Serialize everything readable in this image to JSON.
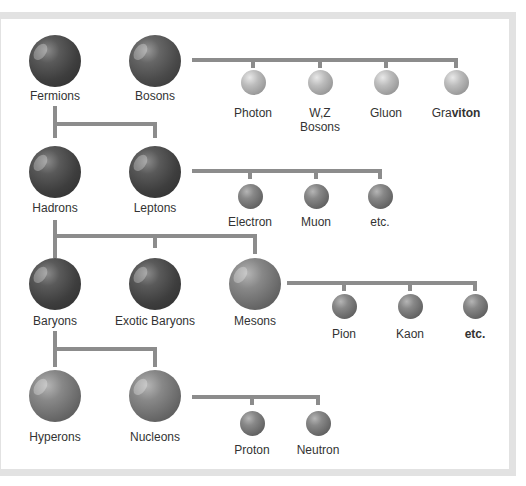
{
  "diagram": {
    "title": "",
    "rows": [
      {
        "nodes": [
          {
            "id": "fermions",
            "label": "Fermions"
          },
          {
            "id": "bosons",
            "label": "Bosons"
          }
        ],
        "children_of": "bosons",
        "children": [
          {
            "id": "photon",
            "label": "Photon"
          },
          {
            "id": "wz-bosons",
            "label": "W,Z",
            "label2": "Bosons"
          },
          {
            "id": "gluon",
            "label": "Gluon"
          },
          {
            "id": "graviton",
            "label": "Graviton",
            "label_plain": "Gra",
            "label_bold": "viton"
          }
        ]
      },
      {
        "nodes": [
          {
            "id": "hadrons",
            "label": "Hadrons"
          },
          {
            "id": "leptons",
            "label": "Leptons"
          }
        ],
        "children_of": "leptons",
        "children": [
          {
            "id": "electron",
            "label": "Electron"
          },
          {
            "id": "muon",
            "label": "Muon"
          },
          {
            "id": "leptons-etc",
            "label": "etc."
          }
        ]
      },
      {
        "nodes": [
          {
            "id": "baryons",
            "label": "Baryons"
          },
          {
            "id": "exotic-baryons",
            "label": "Exotic Baryons"
          },
          {
            "id": "mesons",
            "label": "Mesons"
          }
        ],
        "children_of": "mesons",
        "children": [
          {
            "id": "pion",
            "label": "Pion"
          },
          {
            "id": "kaon",
            "label": "Kaon"
          },
          {
            "id": "mesons-etc",
            "label": "etc."
          }
        ]
      },
      {
        "nodes": [
          {
            "id": "hyperons",
            "label": "Hyperons"
          },
          {
            "id": "nucleons",
            "label": "Nucleons"
          }
        ],
        "children_of": "nucleons",
        "children": [
          {
            "id": "proton",
            "label": "Proton"
          },
          {
            "id": "neutron",
            "label": "Neutron"
          }
        ]
      }
    ],
    "edges": [
      [
        "fermions",
        "hadrons"
      ],
      [
        "fermions",
        "leptons"
      ],
      [
        "hadrons",
        "baryons"
      ],
      [
        "hadrons",
        "exotic-baryons"
      ],
      [
        "hadrons",
        "mesons"
      ],
      [
        "baryons",
        "hyperons"
      ],
      [
        "baryons",
        "nucleons"
      ]
    ],
    "colors": {
      "connector": "#8c8c8c",
      "frame": "#e2e2e2",
      "text": "#333333"
    }
  }
}
